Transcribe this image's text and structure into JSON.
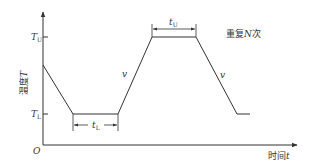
{
  "diagram": {
    "type": "temperature-cycle-profile",
    "y_axis": {
      "label_cn": "温度",
      "label_var": "T"
    },
    "x_axis": {
      "label_cn": "时间",
      "label_var": "t"
    },
    "origin_label": "O",
    "levels": {
      "upper": {
        "base": "T",
        "sub": "U"
      },
      "lower": {
        "base": "T",
        "sub": "L"
      }
    },
    "durations": {
      "upper": {
        "base": "t",
        "sub": "U"
      },
      "lower": {
        "base": "t",
        "sub": "L"
      }
    },
    "rate_label": "v",
    "repeat_note": {
      "prefix": "重复",
      "var": "N",
      "suffix": "次"
    },
    "profile_points": [
      {
        "t": 0,
        "level": "start"
      },
      {
        "t": 1,
        "level": "lower"
      },
      {
        "t": 2,
        "level": "lower"
      },
      {
        "t": 3,
        "level": "upper"
      },
      {
        "t": 4,
        "level": "upper"
      },
      {
        "t": 5,
        "level": "lower"
      },
      {
        "t": 5.3,
        "level": "lower"
      }
    ],
    "colors": {
      "line": "#333333",
      "text": "#333333"
    }
  }
}
